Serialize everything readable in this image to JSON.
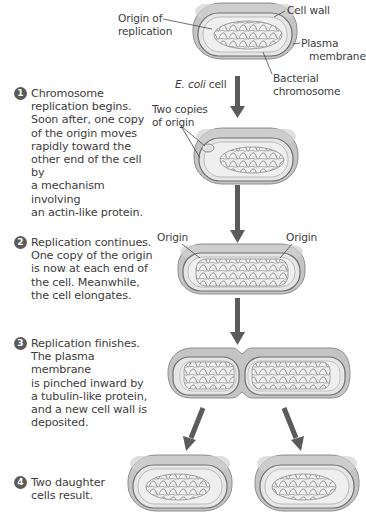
{
  "labels": {
    "origin_of_replication_1": "Origin of",
    "origin_of_replication_2": "replication",
    "cell_wall": "Cell wall",
    "plasma_membrane_1": "Plasma",
    "plasma_membrane_2": "membrane",
    "bacterial_chromosome_1": "Bacterial",
    "bacterial_chromosome_2": "chromosome",
    "ecoli_italic": "E. coli",
    "ecoli_rest": " cell",
    "two_copies_1": "Two copies",
    "two_copies_2": "of origin",
    "origin_left": "Origin",
    "origin_right": "Origin"
  },
  "steps": [
    {
      "number": "1",
      "lines": [
        "Chromosome",
        "replication begins.",
        "Soon after, one copy",
        "of the origin moves",
        "rapidly toward the",
        "other end of the cell by",
        "a mechanism involving",
        "an actin-like protein."
      ]
    },
    {
      "number": "2",
      "lines": [
        "Replication continues.",
        "One copy of the origin",
        "is now at each end of",
        "the cell. Meanwhile,",
        "the cell elongates."
      ]
    },
    {
      "number": "3",
      "lines": [
        "Replication finishes.",
        "The plasma membrane",
        "is pinched inward by",
        "a tubulin-like protein,",
        "and a new cell wall is",
        "deposited."
      ]
    },
    {
      "number": "4",
      "lines": [
        "Two daughter",
        "cells result."
      ]
    }
  ],
  "colors": {
    "cell_wall": "#bdbdbd",
    "cell_wall_edge": "#8e8e8e",
    "membrane": "#6f6f6f",
    "cytoplasm": "#ececec",
    "chromosome": "#8a8a8a",
    "arrow": "#5b5b5b",
    "step_circle": "#5a5a5a"
  }
}
